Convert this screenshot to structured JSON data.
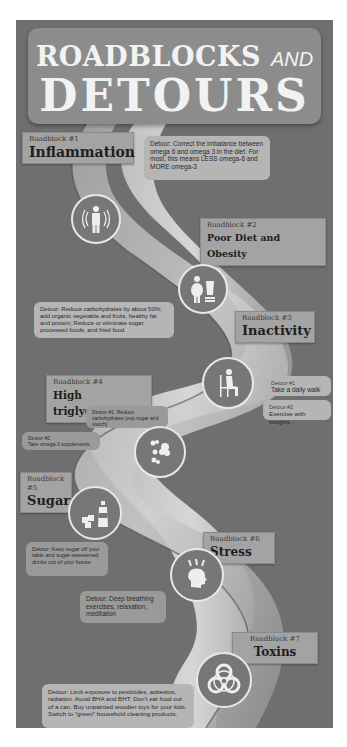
{
  "header": {
    "title_line1": "ROADBLOCKS",
    "title_and": "AND",
    "title_line2": "DETOURS"
  },
  "colors": {
    "background": "#6f6f6f",
    "header_box": "#8c8c8c",
    "road_light": "#d8d8d8",
    "road_mid": "#9c9c9c",
    "label_box": "#a3a3a3",
    "detour_box": "#aaaaaa",
    "title_text": "#f2f2f2"
  },
  "roadblocks": [
    {
      "number": "Roadblock #1",
      "title": "Inflammation",
      "icon": "radiating-person-icon",
      "detours": [
        {
          "text": "Detour: Correct the imbalance between omega 6 and omega 3 in the diet. For most, this means LESS omega-6 and MORE omega-3"
        }
      ]
    },
    {
      "number": "Roadblock #2",
      "title": "Poor Diet and Obesity",
      "icon": "obese-person-drink-icon",
      "detours": [
        {
          "text": "Detour: Reduce carbohydrates by about 50%; add organic vegetable and fruits, healthy fat and protein; Reduce or eliminate sugar, processed foods, and fried food."
        }
      ]
    },
    {
      "number": "Roadblock #3",
      "title": "Inactivity",
      "icon": "seated-person-icon",
      "detours": [
        {
          "label": "Detour #1",
          "text": "Take a daily walk"
        },
        {
          "label": "Detour #2",
          "text": "Exercise with weights"
        }
      ]
    },
    {
      "number": "Roadblock #4",
      "title": "High triglycerides",
      "icon": "molecule-bubbles-icon",
      "detours": [
        {
          "label": "Detour #1:",
          "text": "Reduce carbohydrates (esp sugar and starch)"
        },
        {
          "label": "Detour #2",
          "text": "Take omega-3 supplements"
        }
      ]
    },
    {
      "number": "Roadblock #5",
      "title": "Sugar",
      "icon": "sugar-cubes-bottle-icon",
      "detours": [
        {
          "text": "Detour: Keep sugar off your table and sugar-sweetened drinks out of your house"
        }
      ]
    },
    {
      "number": "Roadblock #6",
      "title": "Stress",
      "icon": "stressed-head-icon",
      "detours": [
        {
          "text": "Detour: Deep breathing exercises, relaxation, meditation"
        }
      ]
    },
    {
      "number": "Roadblock #7",
      "title": "Toxins",
      "icon": "biohazard-icon",
      "detours": [
        {
          "text": "Detour: Limit exposure to pesticides, asbestos, radiation. Avoid BHA and BHT. Don't eat food out of a can. Buy unpainted wooden toys for your kids. Switch to \"green\" household cleaning products."
        }
      ]
    }
  ]
}
